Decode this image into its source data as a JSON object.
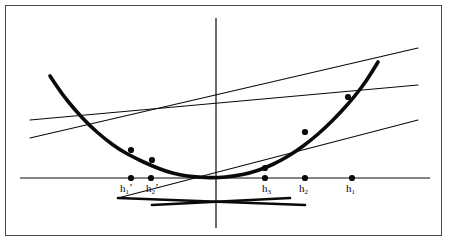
{
  "figure": {
    "background_color": "#ffffff",
    "frame_color": "#4a4a4a",
    "ink_color": "#0a0a0a"
  },
  "axes": {
    "x_axis": {
      "name": "x-axis",
      "y": 178,
      "x_start": 20,
      "x_end": 430
    },
    "y_axis": {
      "name": "y-axis",
      "x": 216,
      "y_start": 18,
      "y_end": 228
    },
    "origin": {
      "x": 216,
      "y": 178
    }
  },
  "chart_data": {
    "type": "line",
    "xlabel": "",
    "ylabel": "",
    "grid": false,
    "legend": "none",
    "curve": {
      "name": "parabola",
      "description": "Thick parabola passing through the origin, opening upward",
      "stroke_width": 3.6,
      "points": [
        [
          50,
          76
        ],
        [
          62,
          94
        ],
        [
          75,
          110
        ],
        [
          90,
          126
        ],
        [
          105,
          139
        ],
        [
          120,
          150
        ],
        [
          135,
          158
        ],
        [
          150,
          165
        ],
        [
          165,
          171
        ],
        [
          180,
          175
        ],
        [
          195,
          177
        ],
        [
          216,
          178
        ],
        [
          235,
          176
        ],
        [
          250,
          173
        ],
        [
          265,
          168
        ],
        [
          280,
          161
        ],
        [
          295,
          152
        ],
        [
          310,
          141
        ],
        [
          325,
          128
        ],
        [
          340,
          113
        ],
        [
          355,
          96
        ],
        [
          367,
          80
        ],
        [
          378,
          62
        ]
      ]
    },
    "secants": [
      {
        "name": "secant-h1",
        "label": "h_1",
        "through_point": [
          365,
          83
        ],
        "line_from": [
          30,
          138
        ],
        "line_to": [
          418,
          48
        ],
        "stroke_width": 1.1
      },
      {
        "name": "secant-h2",
        "label": "h_2",
        "through_point": [
          348,
          97
        ],
        "line_from": [
          30,
          120
        ],
        "line_to": [
          418,
          85
        ],
        "stroke_width": 1.1
      },
      {
        "name": "secant-h3",
        "label": "h_3",
        "through_point": [
          305,
          132
        ],
        "line_from": [
          118,
          198
        ],
        "line_to": [
          418,
          120
        ],
        "stroke_width": 1.1
      },
      {
        "name": "secant-h1prime",
        "label": "h_1'",
        "through_point": [
          131,
          150
        ],
        "line_from": [
          118,
          198
        ],
        "line_to": [
          305,
          205
        ],
        "stroke_width": 2.6
      },
      {
        "name": "secant-h2prime",
        "label": "h_2'",
        "through_point": [
          152,
          160
        ],
        "line_from": [
          152,
          205
        ],
        "line_to": [
          290,
          198
        ],
        "stroke_width": 2.6
      }
    ],
    "x_axis_markers": [
      {
        "name": "marker-h1prime",
        "label_base": "h",
        "label_sub": "1",
        "label_prime": "’",
        "x": 131,
        "y": 178,
        "label_x": 120,
        "label_y": 183,
        "side": "left"
      },
      {
        "name": "marker-h2prime",
        "label_base": "h",
        "label_sub": "2",
        "label_prime": "’",
        "x": 151,
        "y": 178,
        "label_x": 146,
        "label_y": 183,
        "side": "left"
      },
      {
        "name": "marker-h3",
        "label_base": "h",
        "label_sub": "3",
        "label_prime": "",
        "x": 265,
        "y": 178,
        "label_x": 262,
        "label_y": 183,
        "side": "right"
      },
      {
        "name": "marker-h2",
        "label_base": "h",
        "label_sub": "2",
        "label_prime": "",
        "x": 305,
        "y": 178,
        "label_x": 299,
        "label_y": 183,
        "side": "right"
      },
      {
        "name": "marker-h1",
        "label_base": "h",
        "label_sub": "1",
        "label_prime": "",
        "x": 352,
        "y": 178,
        "label_x": 346,
        "label_y": 183,
        "side": "right"
      }
    ],
    "curve_points": [
      {
        "name": "curve-point-h1prime",
        "x": 131,
        "y": 150
      },
      {
        "name": "curve-point-h2prime",
        "x": 152,
        "y": 160
      },
      {
        "name": "curve-point-h3",
        "x": 265,
        "y": 168
      },
      {
        "name": "curve-point-h2",
        "x": 305,
        "y": 132
      },
      {
        "name": "curve-point-h1",
        "x": 348,
        "y": 97
      }
    ],
    "dot_radius": 3.1
  }
}
